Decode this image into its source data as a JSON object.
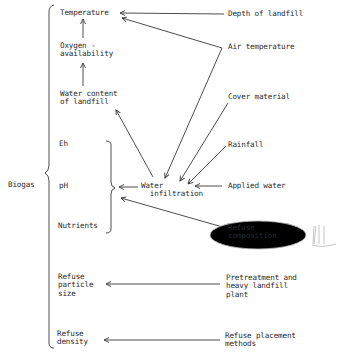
{
  "diagram": {
    "root": {
      "label": "Biogas"
    },
    "factors": [
      {
        "id": "temperature",
        "label": "Temperature"
      },
      {
        "id": "oxygen",
        "label": "Oxygen -\navailability"
      },
      {
        "id": "water_content",
        "label": "Water content\nof landfill"
      },
      {
        "id": "eh",
        "label": "Eh"
      },
      {
        "id": "ph",
        "label": "pH"
      },
      {
        "id": "nutrients",
        "label": "Nutrients"
      },
      {
        "id": "particle_size",
        "label": "Refuse\nparticle\nsize"
      },
      {
        "id": "density",
        "label": "Refuse\ndensity"
      }
    ],
    "intermediate": {
      "id": "water_infiltration",
      "label": "Water\n  infiltration"
    },
    "drivers": [
      {
        "id": "depth",
        "label": "Depth of landfill"
      },
      {
        "id": "air_temp",
        "label": "Air temperature"
      },
      {
        "id": "cover",
        "label": "Cover material"
      },
      {
        "id": "rainfall",
        "label": "Rainfall"
      },
      {
        "id": "applied_water",
        "label": "Applied water"
      },
      {
        "id": "refuse_comp",
        "label": "Refuse\ncomposition"
      },
      {
        "id": "pretreatment",
        "label": "Pretreatment and\nheavy landfill\nplant"
      },
      {
        "id": "placement",
        "label": "Refuse placement\nmethods"
      }
    ],
    "edges": [
      {
        "from": "oxygen",
        "to": "temperature"
      },
      {
        "from": "water_content",
        "to": "oxygen"
      },
      {
        "from": "depth",
        "to": "temperature"
      },
      {
        "from": "air_temp",
        "to": "temperature"
      },
      {
        "from": "air_temp",
        "to": "water_infiltration"
      },
      {
        "from": "cover",
        "to": "water_infiltration"
      },
      {
        "from": "rainfall",
        "to": "water_infiltration"
      },
      {
        "from": "applied_water",
        "to": "water_infiltration"
      },
      {
        "from": "water_infiltration",
        "to": "water_content"
      },
      {
        "from": "water_infiltration",
        "to": "eh_ph_nutrients"
      },
      {
        "from": "refuse_comp",
        "to": "eh_ph_nutrients"
      },
      {
        "from": "pretreatment",
        "to": "particle_size"
      },
      {
        "from": "placement",
        "to": "density"
      }
    ]
  }
}
